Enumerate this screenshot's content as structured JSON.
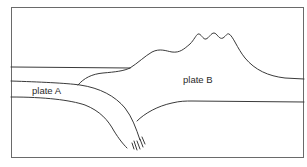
{
  "diagram": {
    "labels": {
      "plate_a": "plate A",
      "plate_b": "plate B"
    },
    "colors": {
      "line": "#3a3a3a",
      "frame": "#6a6a6a",
      "background": "#ffffff"
    }
  }
}
